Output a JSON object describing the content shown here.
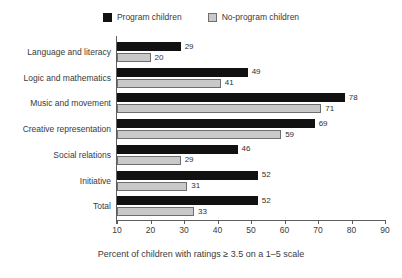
{
  "chart_data": {
    "type": "bar",
    "orientation": "horizontal",
    "title": "",
    "xlabel": "Percent of children with ratings ≥ 3.5 on a 1–5 scale",
    "ylabel": "",
    "xlim": [
      10,
      90
    ],
    "xticks": [
      10,
      20,
      30,
      40,
      50,
      60,
      70,
      80,
      90
    ],
    "grid": false,
    "legend_position": "top-center",
    "categories": [
      "Language and literacy",
      "Logic and mathematics",
      "Music and movement",
      "Creative representation",
      "Social relations",
      "Initiative",
      "Total"
    ],
    "series": [
      {
        "name": "Program children",
        "color": "#111111",
        "values": [
          29,
          49,
          78,
          69,
          46,
          52,
          52
        ]
      },
      {
        "name": "No-program children",
        "color": "#c9c9c9",
        "values": [
          20,
          41,
          71,
          59,
          29,
          31,
          33
        ]
      }
    ]
  },
  "legend": {
    "items": [
      {
        "label": "Program children",
        "swatch": "program"
      },
      {
        "label": "No-program children",
        "swatch": "noprogram"
      }
    ]
  },
  "axis": {
    "x_caption": "Percent of children with ratings ≥ 3.5 on a 1–5 scale",
    "tick_labels": [
      "10",
      "20",
      "30",
      "40",
      "50",
      "60",
      "70",
      "80",
      "90"
    ]
  },
  "colors": {
    "program_bar": "#111111",
    "noprogram_bar": "#c9c9c9",
    "noprogram_border": "#6e6e6e",
    "axis": "#5d5d5d",
    "text": "#3a3a3a",
    "background": "#ffffff"
  }
}
